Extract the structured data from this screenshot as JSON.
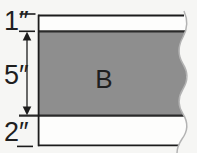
{
  "figure": {
    "kind": "layered cross-section diagram with torn right edge",
    "labels": {
      "top_layer_thickness": "1″",
      "middle_layer_thickness": "5″",
      "bottom_layer_thickness": "2″",
      "middle_region": "B"
    },
    "colors": {
      "background": "#f6f6f4",
      "layer_fill": "#fdfdfc",
      "band_fill": "#8e8e8e",
      "boundary": "#2a2a2a",
      "line": "#1c1c1c",
      "torn_edge": "#b3b3b3",
      "text": "#1f1f1f"
    }
  }
}
